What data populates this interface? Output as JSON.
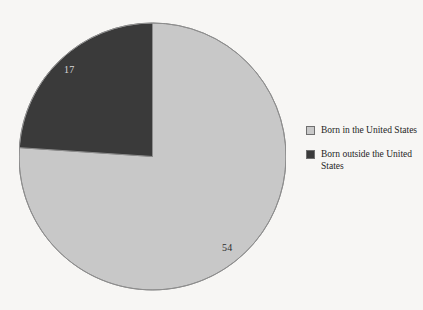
{
  "chart_data": {
    "type": "pie",
    "title": "",
    "subtitle": "",
    "xlabel": "",
    "ylabel": "",
    "grid": false,
    "legend_position": "right",
    "categories": [
      "Born in the United States",
      "Born outside the United States"
    ],
    "values": [
      54,
      17
    ],
    "value_labels": [
      "54",
      "17"
    ],
    "total": 71,
    "start_angle_deg": 0,
    "direction": "clockwise",
    "slices": [
      {
        "label": "Born in the United States",
        "value": 54,
        "value_label": "54",
        "percent": 76.1,
        "sweep_deg": 273.8,
        "color": "#c8c8c8",
        "label_color": "#2c2c2c"
      },
      {
        "label": "Born outside the United States",
        "value": 17,
        "value_label": "17",
        "percent": 23.9,
        "sweep_deg": 86.2,
        "color": "#3a3a3a",
        "label_color": "#d8d8d8"
      }
    ]
  },
  "legend": {
    "items": [
      {
        "label": "Born in the United States",
        "swatch_name": "legend-swatch-born-in-us",
        "color": "#c8c8c8"
      },
      {
        "label": "Born outside the United States",
        "swatch_name": "legend-swatch-born-outside-us",
        "color": "#3a3a3a"
      }
    ]
  },
  "colors": {
    "background": "#f7f6f4",
    "slice_light": "#c8c8c8",
    "slice_dark": "#3a3a3a",
    "outline": "#8d8d8d",
    "text": "#1f1f1f"
  }
}
